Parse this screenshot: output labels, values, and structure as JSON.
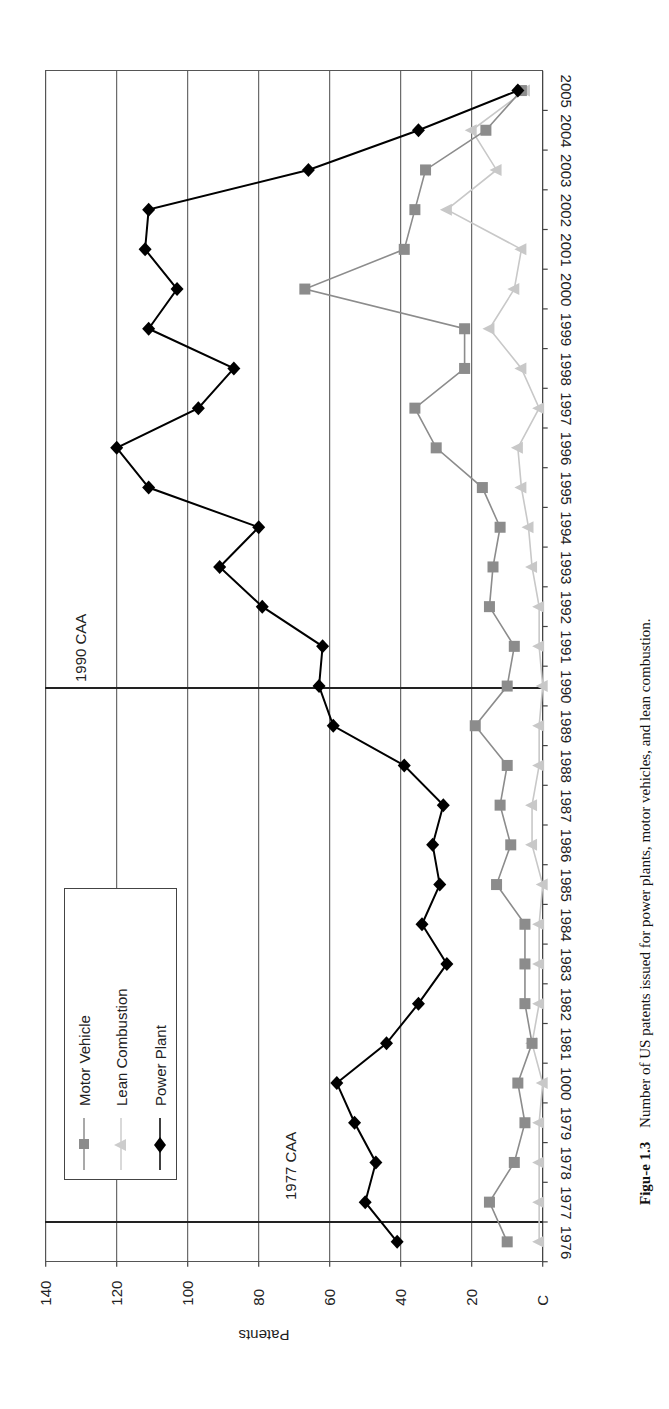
{
  "chart_data": {
    "type": "line",
    "orientation": "rotated 90 degrees counter-clockwise on page (years run bottom-to-top, values increase right-to-left)",
    "title": "",
    "xlabel": "",
    "ylabel": "Patents",
    "ylim": [
      0,
      140
    ],
    "yticks": [
      0,
      20,
      40,
      60,
      80,
      100,
      120,
      140
    ],
    "ytick_labels": [
      "C",
      "20",
      "40",
      "60",
      "80",
      "100",
      "120",
      "140"
    ],
    "grid": true,
    "categories": [
      1976,
      1977,
      1978,
      1979,
      1980,
      1981,
      1982,
      1983,
      1984,
      1985,
      1986,
      1987,
      1988,
      1989,
      1990,
      1991,
      1992,
      1993,
      1994,
      1995,
      1996,
      1997,
      1998,
      1999,
      2000,
      2001,
      2002,
      2003,
      2004,
      2005
    ],
    "category_labels": [
      "1976",
      "1977",
      "1978",
      "1979",
      "1000",
      "1981",
      "1982",
      "1983",
      "1984",
      "1985",
      "1986",
      "1987",
      "1988",
      "1989",
      "1990",
      "1991",
      "1992",
      "1993",
      "1994",
      "1995",
      "1996",
      "1997",
      "1998",
      "1999",
      "2000",
      "2001",
      "2002",
      "2003",
      "2004",
      "2005"
    ],
    "series": [
      {
        "name": "Motor Vehicle",
        "marker": "square",
        "color": "#8c8c8c",
        "values": [
          10,
          15,
          8,
          5,
          7,
          3,
          5,
          5,
          5,
          13,
          9,
          12,
          10,
          19,
          10,
          8,
          15,
          14,
          12,
          17,
          30,
          36,
          22,
          22,
          67,
          39,
          36,
          33,
          16,
          6
        ]
      },
      {
        "name": "Lean Combustion",
        "marker": "triangle",
        "color": "#c8c8c8",
        "values": [
          1,
          1,
          1,
          1,
          0,
          3,
          1,
          1,
          1,
          0,
          3,
          3,
          1,
          1,
          0,
          1,
          1,
          3,
          4,
          6,
          7,
          1,
          6,
          15,
          8,
          6,
          27,
          13,
          20,
          5
        ]
      },
      {
        "name": "Power Plant",
        "marker": "diamond",
        "color": "#000000",
        "values": [
          41,
          50,
          47,
          53,
          58,
          44,
          35,
          27,
          34,
          29,
          31,
          28,
          39,
          59,
          63,
          62,
          79,
          91,
          80,
          111,
          120,
          97,
          87,
          111,
          103,
          112,
          111,
          66,
          35,
          7
        ]
      }
    ],
    "annotations": [
      {
        "label": "1977 CAA",
        "position_between": [
          1976,
          1977
        ],
        "type": "vertical-line"
      },
      {
        "label": "1990 CAA",
        "position_at": 1990,
        "type": "vertical-line"
      }
    ],
    "legend": {
      "position": "upper-left (in rotated view)",
      "entries": [
        "Motor Vehicle",
        "Lean Combustion",
        "Power Plant"
      ]
    }
  },
  "legend": {
    "items": [
      {
        "label": "Motor Vehicle"
      },
      {
        "label": "Lean Combustion"
      },
      {
        "label": "Power Plant"
      }
    ]
  },
  "axis": {
    "y_title": "Patents"
  },
  "events": {
    "caa1977": "1977 CAA",
    "caa1990": "1990 CAA"
  },
  "caption": {
    "figure_label": "Figu-e 1.3",
    "text": "Number of US patents issued for power plants, motor vehicles, and lean combustion."
  }
}
